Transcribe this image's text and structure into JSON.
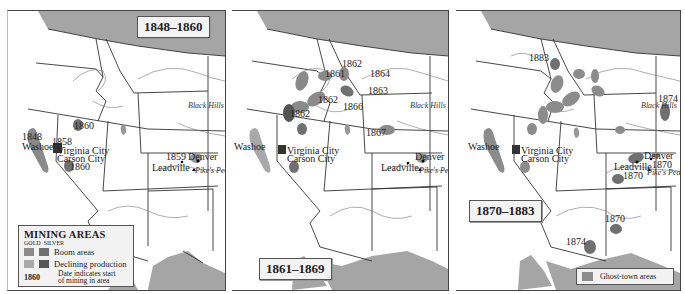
{
  "colors": {
    "land": "#ffffff",
    "foreign": "#a5a5a5",
    "border": "#333333",
    "river": "#666666",
    "gold_boom": "#8a8a8a",
    "silver_boom": "#707070",
    "gold_declining": "#a9a9a9",
    "silver_declining": "#555555",
    "ghost_town": "#8c8c8c"
  },
  "panels": [
    {
      "title": "1848–1860",
      "labels": {
        "washoe": "Washoe",
        "washoe_date": "1848",
        "virginia_city": "Virginia City",
        "virginia_date": "1858",
        "carson_city": "Carson City",
        "nevada_1860_north": "1860",
        "nevada_1860_south": "1860",
        "denver": "Denver",
        "denver_date": "1859",
        "leadville": "Leadville",
        "pikes_peak": "Pike's Peak",
        "black_hills": "Black Hills"
      },
      "legend": {
        "title": "MINING AREAS",
        "columns": [
          "GOLD",
          "SILVER"
        ],
        "rows": [
          {
            "label": "Boom areas"
          },
          {
            "label": "Declining production"
          }
        ],
        "date_example": "1860",
        "date_desc_1": "Date indicates start",
        "date_desc_2": "of mining in area"
      }
    },
    {
      "title": "1861–1869",
      "labels": {
        "d1862_a": "1862",
        "d1861": "1861",
        "d1864": "1864",
        "d1863": "1863",
        "d1862_b": "1862",
        "d1866": "1866",
        "d1862_c": "1862",
        "d1867": "1867",
        "washoe": "Washoe",
        "virginia_city": "Virginia City",
        "carson_city": "Carson City",
        "denver": "Denver",
        "leadville": "Leadville",
        "pikes_peak": "Pike's Peak",
        "black_hills": "Black Hills"
      }
    },
    {
      "title": "1870–1883",
      "labels": {
        "d1883": "1883",
        "d1874_bh": "1874",
        "washoe": "Washoe",
        "virginia_city": "Virginia City",
        "carson_city": "Carson City",
        "denver": "Denver",
        "denver_date": "1870",
        "leadville": "Leadville",
        "leadville_date": "1870",
        "pikes_peak": "Pike's Peak",
        "black_hills": "Black Hills",
        "d1870_az": "1870",
        "d1874_az": "1874"
      },
      "legend": {
        "label": "Ghost-town areas"
      }
    }
  ]
}
